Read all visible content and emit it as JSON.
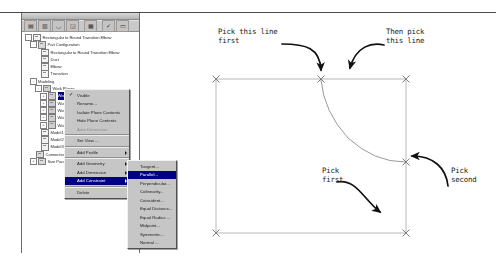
{
  "window": {
    "browser_panel_title": "",
    "toolbar_buttons": [
      {
        "name": "sketch-icon",
        "glyph": "▤"
      },
      {
        "name": "extrude-icon",
        "glyph": "▥"
      },
      {
        "name": "revolve-icon",
        "glyph": "◡"
      },
      {
        "name": "hole-icon",
        "glyph": "◲"
      },
      {
        "name": "shell-icon",
        "glyph": "▦"
      },
      {
        "name": "check-icon",
        "glyph": "✓"
      },
      {
        "name": "finish-icon",
        "glyph": "▭"
      }
    ]
  },
  "tree": {
    "items": [
      {
        "label": "Rectangular to Round Transition Elbow",
        "depth": 0,
        "expander": "-",
        "icon": "doc",
        "selected": false
      },
      {
        "label": "Part Configuration",
        "depth": 1,
        "expander": "-",
        "icon": "folder",
        "selected": false
      },
      {
        "label": "Rectangular to Round Transition Elbow",
        "depth": 2,
        "expander": "",
        "icon": "doc",
        "selected": false
      },
      {
        "label": "Duct",
        "depth": 2,
        "expander": "",
        "icon": "doc",
        "selected": false
      },
      {
        "label": "Elbow",
        "depth": 2,
        "expander": "",
        "icon": "doc",
        "selected": false
      },
      {
        "label": "Transition",
        "depth": 2,
        "expander": "",
        "icon": "doc",
        "selected": false
      },
      {
        "label": "Modeling",
        "depth": 1,
        "expander": "-",
        "icon": "none",
        "selected": false
      },
      {
        "label": "Work Planes",
        "depth": 2,
        "expander": "-",
        "icon": "plane",
        "selected": false
      },
      {
        "label": "Work Plane1",
        "depth": 3,
        "expander": "+",
        "icon": "plane",
        "selected": true
      },
      {
        "label": "Work Plane2",
        "depth": 3,
        "expander": "+",
        "icon": "plane",
        "selected": false
      },
      {
        "label": "Work Plane3",
        "depth": 3,
        "expander": "+",
        "icon": "plane",
        "selected": false
      },
      {
        "label": "Work Plane4",
        "depth": 3,
        "expander": "+",
        "icon": "plane",
        "selected": false
      },
      {
        "label": "Work Plane5",
        "depth": 3,
        "expander": "+",
        "icon": "plane",
        "selected": false
      },
      {
        "label": "Model1",
        "depth": 2,
        "expander": "",
        "icon": "doc",
        "selected": false
      },
      {
        "label": "Model2",
        "depth": 2,
        "expander": "",
        "icon": "doc",
        "selected": false
      },
      {
        "label": "Model3",
        "depth": 2,
        "expander": "",
        "icon": "doc",
        "selected": false
      },
      {
        "label": "Connections",
        "depth": 1,
        "expander": "",
        "icon": "folder",
        "selected": false
      },
      {
        "label": "Size Parameters",
        "depth": 1,
        "expander": "+",
        "icon": "folder",
        "selected": false
      }
    ]
  },
  "context_menu": {
    "items": [
      {
        "label": "Visible",
        "checked": true,
        "arrow": false,
        "highlight": false,
        "disabled": false,
        "separator_after": false
      },
      {
        "label": "Rename...",
        "checked": false,
        "arrow": false,
        "highlight": false,
        "disabled": false,
        "separator_after": false
      },
      {
        "label": "Isolate Plane Contents",
        "checked": false,
        "arrow": false,
        "highlight": false,
        "disabled": false,
        "separator_after": false
      },
      {
        "label": "Hide Plane Contents",
        "checked": false,
        "arrow": false,
        "highlight": false,
        "disabled": false,
        "separator_after": false
      },
      {
        "label": "Auto Dimension",
        "checked": false,
        "arrow": false,
        "highlight": false,
        "disabled": true,
        "separator_after": true
      },
      {
        "label": "Set View ...",
        "checked": false,
        "arrow": false,
        "highlight": false,
        "disabled": false,
        "separator_after": true
      },
      {
        "label": "Add Profile",
        "checked": false,
        "arrow": true,
        "highlight": false,
        "disabled": false,
        "separator_after": true
      },
      {
        "label": "Add Geometry",
        "checked": false,
        "arrow": true,
        "highlight": false,
        "disabled": false,
        "separator_after": false
      },
      {
        "label": "Add Dimension",
        "checked": false,
        "arrow": true,
        "highlight": false,
        "disabled": false,
        "separator_after": false
      },
      {
        "label": "Add Constraint",
        "checked": false,
        "arrow": true,
        "highlight": true,
        "disabled": false,
        "separator_after": true
      },
      {
        "label": "Delete",
        "checked": false,
        "arrow": false,
        "highlight": false,
        "disabled": false,
        "separator_after": false
      }
    ]
  },
  "submenu": {
    "items": [
      {
        "label": "Tangent...",
        "highlight": false
      },
      {
        "label": "Parallel...",
        "highlight": true
      },
      {
        "label": "Perpendicular...",
        "highlight": false
      },
      {
        "label": "Colinearity...",
        "highlight": false
      },
      {
        "label": "Coincident...",
        "highlight": false
      },
      {
        "label": "Equal Distance...",
        "highlight": false
      },
      {
        "label": "Equal Radius ...",
        "highlight": false
      },
      {
        "label": "Midpoint...",
        "highlight": false
      },
      {
        "label": "Symmetric...",
        "highlight": false
      },
      {
        "label": "Normal ...",
        "highlight": false
      }
    ]
  },
  "annotations": {
    "pick_this_line_first": "Pick this line\nfirst",
    "then_pick_this_line": "Then pick\nthis line",
    "pick_first": "Pick\nfirst",
    "pick_second": "Pick\nsecond"
  },
  "sketch": {
    "description": "Sketch profile showing a rectangle of construction lines with X vertex markers and a tangent arc",
    "line_color": "#b0b0b0",
    "arrow_color": "#111111",
    "vertices": [
      {
        "x": 20,
        "y": 67
      },
      {
        "x": 125,
        "y": 67
      },
      {
        "x": 210,
        "y": 67
      },
      {
        "x": 210,
        "y": 148
      },
      {
        "x": 210,
        "y": 221
      },
      {
        "x": 20,
        "y": 221
      }
    ]
  }
}
